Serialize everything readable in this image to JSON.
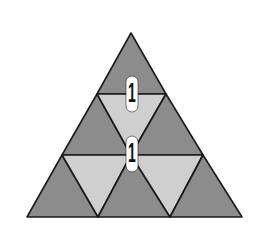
{
  "diagram": {
    "colors": {
      "dark_fill": "#8c8c8c",
      "light_fill": "#cfcfcf",
      "outline": "#1a1a1a",
      "label_bg": "#ffffff"
    },
    "triangles": [
      {
        "row": 1,
        "shade": "dark",
        "points": "131,33 97,94 166,94"
      },
      {
        "row": 2,
        "shade": "dark",
        "points": "97,94 62,155 131,155"
      },
      {
        "row": 2,
        "shade": "light",
        "points": "97,94 166,94 131,155"
      },
      {
        "row": 2,
        "shade": "dark",
        "points": "166,94 131,155 203,155"
      },
      {
        "row": 3,
        "shade": "dark",
        "points": "62,155 27,217 98,217"
      },
      {
        "row": 3,
        "shade": "light",
        "points": "62,155 131,155 98,217"
      },
      {
        "row": 3,
        "shade": "dark",
        "points": "131,155 98,217 170,217"
      },
      {
        "row": 3,
        "shade": "light",
        "points": "131,155 203,155 170,217"
      },
      {
        "row": 3,
        "shade": "dark",
        "points": "203,155 170,217 242,217"
      }
    ],
    "labels": [
      {
        "text": "1",
        "x": 132,
        "y": 94
      },
      {
        "text": "1",
        "x": 132,
        "y": 154
      }
    ]
  }
}
